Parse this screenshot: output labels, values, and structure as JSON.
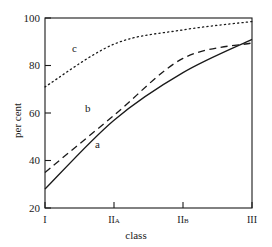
{
  "chart_data": {
    "type": "line",
    "title": "",
    "xlabel": "class",
    "ylabel": "per cent",
    "categories": [
      "I",
      "IIa",
      "IIb",
      "III"
    ],
    "x": [
      0,
      1,
      2,
      3
    ],
    "ylim": [
      20,
      100
    ],
    "xlim": [
      0,
      3
    ],
    "yticks": [
      20,
      40,
      60,
      80,
      100
    ],
    "ytick_labels": [
      "20",
      "40",
      "60",
      "80",
      "100"
    ],
    "xtick_labels": [
      "I",
      "IIa",
      "IIb",
      "III"
    ],
    "grid": false,
    "legend_position": "inline-annotations",
    "series": [
      {
        "name": "a",
        "style": "solid",
        "color": "#1a1a1a",
        "values": [
          28,
          57,
          77,
          91
        ],
        "label_text": "a"
      },
      {
        "name": "b",
        "style": "dashed",
        "color": "#1a1a1a",
        "values": [
          35,
          59,
          83,
          89.5
        ],
        "label_text": "b"
      },
      {
        "name": "c",
        "style": "dotted",
        "color": "#1a1a1a",
        "values": [
          71,
          89,
          95,
          98.5
        ],
        "label_text": "c"
      }
    ],
    "annotations": [
      {
        "text": "c",
        "x_px": 72,
        "y_px": 43
      },
      {
        "text": "b",
        "x_px": 85,
        "y_px": 103
      },
      {
        "text": "a",
        "x_px": 95,
        "y_px": 139
      }
    ]
  },
  "axis": {
    "y_title": "per cent",
    "x_title": "class",
    "y_tick_0": "20",
    "y_tick_1": "40",
    "y_tick_2": "60",
    "y_tick_3": "80",
    "y_tick_4": "100",
    "x_tick_0": "I",
    "x_tick_1": "IIa",
    "x_tick_2": "IIb",
    "x_tick_3": "III"
  },
  "labels": {
    "series_a": "a",
    "series_b": "b",
    "series_c": "c"
  },
  "colors": {
    "line": "#1a1a1a",
    "axis": "#1a1a1a",
    "background": "#ffffff"
  }
}
